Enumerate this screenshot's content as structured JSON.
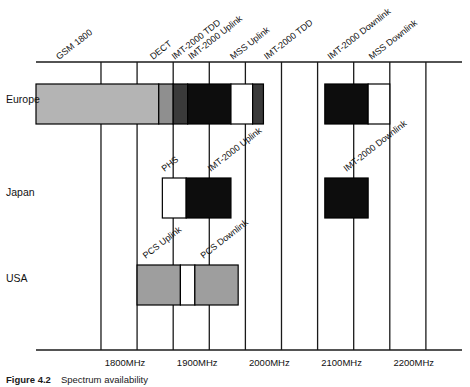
{
  "figure": {
    "caption_number": "Figure 4.2",
    "caption_text": "Spectrum availability"
  },
  "rows": [
    {
      "id": "europe",
      "label": "Europe"
    },
    {
      "id": "japan",
      "label": "Japan"
    },
    {
      "id": "usa",
      "label": "USA"
    }
  ],
  "axis": {
    "unit": "MHz",
    "tick_labels": [
      "1800MHz",
      "1900MHz",
      "2000MHz",
      "2100MHz",
      "2200MHz"
    ],
    "tick_values": [
      1800,
      1900,
      2000,
      2100,
      2200
    ],
    "range": [
      1710,
      2300
    ]
  },
  "callouts": {
    "top": [
      "GSM 1800",
      "DECT",
      "IMT-2000 TDD",
      "IMT-2000 Uplink",
      "MSS Uplink",
      "IMT-2000 TDD",
      "IMT-2000 Downlink",
      "MSS Downlink"
    ],
    "japan": [
      "PHS",
      "IMT-2000 Uplink",
      "IMT-2000 Downlink"
    ],
    "usa": [
      "PCS Uplink",
      "PCS Downlink"
    ]
  },
  "colors": {
    "light_gray": "#b4b4b4",
    "mid_gray": "#8f8f8f",
    "dark_gray": "#3a3a3a",
    "black": "#0d0d0d",
    "white": "#ffffff",
    "usa_gray": "#9e9e9e",
    "line": "#1a1a1a"
  },
  "chart_data": {
    "type": "bar",
    "title": "Spectrum availability",
    "xlabel": "",
    "ylabel": "",
    "xlim": [
      1710,
      2300
    ],
    "grid": true,
    "legend": "none",
    "orientation": "horizontal-ranges",
    "categories": [
      "Europe",
      "Japan",
      "USA"
    ],
    "series": [
      {
        "name": "Europe",
        "segments": [
          {
            "label": "GSM 1800",
            "start": 1710,
            "end": 1880,
            "fill": "light_gray"
          },
          {
            "label": "DECT",
            "start": 1880,
            "end": 1900,
            "fill": "mid_gray"
          },
          {
            "label": "IMT-2000 TDD",
            "start": 1900,
            "end": 1920,
            "fill": "dark_gray"
          },
          {
            "label": "IMT-2000 Uplink",
            "start": 1920,
            "end": 1980,
            "fill": "black"
          },
          {
            "label": "MSS Uplink",
            "start": 1980,
            "end": 2010,
            "fill": "white"
          },
          {
            "label": "IMT-2000 TDD",
            "start": 2010,
            "end": 2025,
            "fill": "dark_gray"
          },
          {
            "label": "IMT-2000 Downlink",
            "start": 2110,
            "end": 2170,
            "fill": "black"
          },
          {
            "label": "MSS Downlink",
            "start": 2170,
            "end": 2200,
            "fill": "white"
          }
        ]
      },
      {
        "name": "Japan",
        "segments": [
          {
            "label": "PHS",
            "start": 1885,
            "end": 1918,
            "fill": "white"
          },
          {
            "label": "IMT-2000 Uplink",
            "start": 1918,
            "end": 1980,
            "fill": "black"
          },
          {
            "label": "IMT-2000 Downlink",
            "start": 2110,
            "end": 2170,
            "fill": "black"
          }
        ]
      },
      {
        "name": "USA",
        "segments": [
          {
            "label": "PCS Uplink",
            "start": 1850,
            "end": 1910,
            "fill": "usa_gray"
          },
          {
            "label": "gap",
            "start": 1910,
            "end": 1930,
            "fill": "white"
          },
          {
            "label": "PCS Downlink",
            "start": 1930,
            "end": 1990,
            "fill": "usa_gray"
          }
        ]
      }
    ]
  }
}
